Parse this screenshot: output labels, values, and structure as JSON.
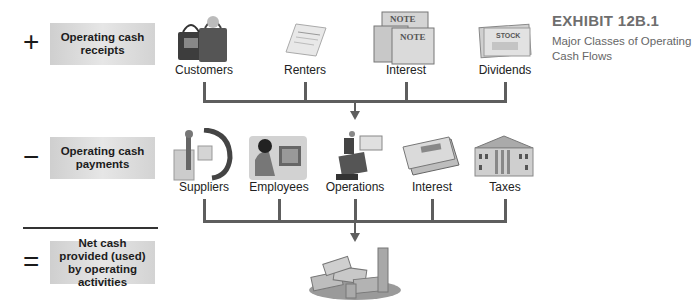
{
  "exhibit": {
    "title": "EXHIBIT 12B.1",
    "subtitle": "Major Classes of Operating Cash Flows"
  },
  "rows": {
    "receipts": {
      "operator": "+",
      "label": "Operating cash receipts",
      "sources": [
        {
          "label": "Customers",
          "icon": "shopping-bags-icon"
        },
        {
          "label": "Renters",
          "icon": "rental-agreement-icon"
        },
        {
          "label": "Interest",
          "icon": "notes-icon"
        },
        {
          "label": "Dividends",
          "icon": "stock-certificate-icon"
        }
      ]
    },
    "payments": {
      "operator": "−",
      "label": "Operating cash payments",
      "sources": [
        {
          "label": "Suppliers",
          "icon": "supplier-boxes-icon"
        },
        {
          "label": "Employees",
          "icon": "employee-computer-icon"
        },
        {
          "label": "Operations",
          "icon": "operations-equipment-icon"
        },
        {
          "label": "Interest",
          "icon": "checks-icon"
        },
        {
          "label": "Taxes",
          "icon": "government-building-icon"
        }
      ]
    },
    "net": {
      "operator": "=",
      "label": "Net cash provided (used) by operating activities",
      "icon": "money-pile-icon"
    }
  },
  "colors": {
    "connector": "#5e5e5e",
    "box": "#dcdcdc",
    "exhibit_title": "#6e6e6e"
  }
}
